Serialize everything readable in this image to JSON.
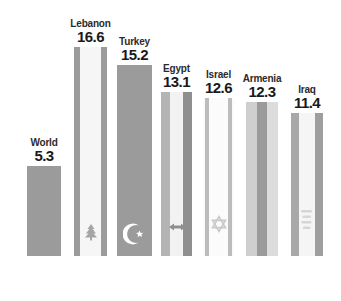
{
  "chart_data": {
    "type": "bar",
    "title": "",
    "subtitle": "",
    "xlabel": "",
    "ylabel": "",
    "ylim": [
      0,
      16.6
    ],
    "grid": false,
    "legend": "none",
    "categories": [
      "World",
      "Lebanon",
      "Turkey",
      "Egypt",
      "Israel",
      "Armenia",
      "Iraq"
    ],
    "values": [
      5.3,
      16.6,
      15.2,
      13.1,
      12.6,
      12.3,
      11.4
    ],
    "value_labels": [
      "5.3",
      "16.6",
      "15.2",
      "13.1",
      "12.6",
      "12.3",
      "11.4"
    ],
    "bars": [
      {
        "category": "World",
        "value": 5.3,
        "value_label": "5.3",
        "flag": "none",
        "emblem": "none",
        "base_color": "#9b9b9b",
        "left": 27,
        "width": 34,
        "height": 90
      },
      {
        "category": "Lebanon",
        "value": 16.6,
        "value_label": "16.6",
        "flag": "lebanon-flag",
        "emblem": "cedar-tree-icon",
        "base_color": "#f4f4f4",
        "stripe_color": "#9b9b9b",
        "left": 74,
        "width": 33,
        "height": 209
      },
      {
        "category": "Turkey",
        "value": 15.2,
        "value_label": "15.2",
        "flag": "turkey-flag",
        "emblem": "crescent-star-icon",
        "base_color": "#9b9b9b",
        "left": 117,
        "width": 35,
        "height": 191
      },
      {
        "category": "Egypt",
        "value": 13.1,
        "value_label": "13.1",
        "flag": "egypt-flag",
        "emblem": "eagle-icon",
        "base_color": "#f1f1f1",
        "stripe_color": "#b0b0b0",
        "left": 161,
        "width": 31,
        "height": 164
      },
      {
        "category": "Israel",
        "value": 12.6,
        "value_label": "12.6",
        "flag": "israel-flag",
        "emblem": "star-of-david-icon",
        "base_color": "#fafafa",
        "stripe_color": "#b8b8b8",
        "left": 203,
        "width": 31,
        "height": 158
      },
      {
        "category": "Armenia",
        "value": 12.3,
        "value_label": "12.3",
        "flag": "armenia-flag",
        "emblem": "none",
        "base_color": "#d9d9d9",
        "stripe_color": "#9b9b9b",
        "left": 246,
        "width": 32,
        "height": 154
      },
      {
        "category": "Iraq",
        "value": 11.4,
        "value_label": "11.4",
        "flag": "iraq-flag",
        "emblem": "arabic-script-icon",
        "base_color": "#f2f2f2",
        "stripe_color": "#a6a6a6",
        "left": 291,
        "width": 32,
        "height": 143
      }
    ]
  },
  "colors": {
    "background": "#ffffff",
    "bar_gray": "#9b9b9b",
    "bar_light": "#f4f4f4",
    "text": "#1a1a1a"
  }
}
